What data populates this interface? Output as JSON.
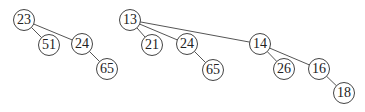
{
  "diagram": {
    "title": "",
    "trees": [
      {
        "name": "tree-1",
        "root": "23",
        "nodes": [
          {
            "id": "t1n23",
            "label": "23",
            "x": 24,
            "y": 20
          },
          {
            "id": "t1n51",
            "label": "51",
            "x": 49,
            "y": 45
          },
          {
            "id": "t1n24",
            "label": "24",
            "x": 82,
            "y": 44
          },
          {
            "id": "t1n65",
            "label": "65",
            "x": 107,
            "y": 69
          }
        ],
        "edges": [
          [
            "t1n23",
            "t1n51"
          ],
          [
            "t1n23",
            "t1n24"
          ],
          [
            "t1n24",
            "t1n65"
          ]
        ]
      },
      {
        "name": "tree-2",
        "root": "13",
        "nodes": [
          {
            "id": "t2n13",
            "label": "13",
            "x": 130,
            "y": 20
          },
          {
            "id": "t2n21",
            "label": "21",
            "x": 152,
            "y": 45
          },
          {
            "id": "t2n24",
            "label": "24",
            "x": 187,
            "y": 44
          },
          {
            "id": "t2n65",
            "label": "65",
            "x": 213,
            "y": 70
          },
          {
            "id": "t2n14",
            "label": "14",
            "x": 260,
            "y": 44
          },
          {
            "id": "t2n26",
            "label": "26",
            "x": 284,
            "y": 69
          },
          {
            "id": "t2n16",
            "label": "16",
            "x": 319,
            "y": 69
          },
          {
            "id": "t2n18",
            "label": "18",
            "x": 344,
            "y": 93
          }
        ],
        "edges": [
          [
            "t2n13",
            "t2n21"
          ],
          [
            "t2n13",
            "t2n24"
          ],
          [
            "t2n13",
            "t2n14"
          ],
          [
            "t2n24",
            "t2n65"
          ],
          [
            "t2n14",
            "t2n26"
          ],
          [
            "t2n14",
            "t2n16"
          ],
          [
            "t2n16",
            "t2n18"
          ]
        ]
      }
    ],
    "colors": {
      "edge": "#555555",
      "node_border": "#444444",
      "node_fill": "#ffffff",
      "text": "#222222"
    }
  }
}
